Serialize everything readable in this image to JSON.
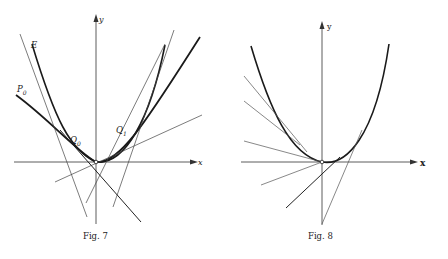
{
  "figures": [
    {
      "id": "fig7",
      "caption": "Fig. 7",
      "axes": {
        "x_label": "x",
        "y_label": "y"
      },
      "points": {
        "E": "E",
        "P0_main": "P",
        "P0_sub": "0",
        "Q0_main": "Q",
        "Q0_sub": "0",
        "Q1_main": "Q",
        "Q1_sub": "1"
      },
      "description": "Parabola-like curve with tangent lines; point P0 on a heavier curve, Q0 and Q1 tangency points, E labels a steep tangent."
    },
    {
      "id": "fig8",
      "caption": "Fig. 8",
      "axes": {
        "x_label": "x",
        "y_label": "y"
      },
      "description": "Convex curve through origin with family of tangent lines meeting below the x-axis."
    }
  ]
}
